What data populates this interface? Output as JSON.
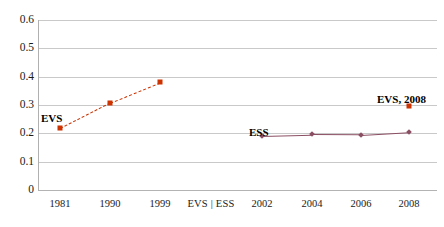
{
  "chart_data": {
    "type": "line",
    "title": "",
    "subtitle": "",
    "xlabel": "",
    "ylabel": "",
    "ylim": [
      0,
      0.6
    ],
    "grid": true,
    "legend_position": "none",
    "y_ticks": [
      "0.6",
      "0.5",
      "0.4",
      "0.3",
      "0.2",
      "0.1",
      "0"
    ],
    "y_tick_values": [
      0.6,
      0.5,
      0.4,
      0.3,
      0.2,
      0.1,
      0
    ],
    "x_tick_labels": [
      "1981",
      "1990",
      "1999",
      "EVS | ESS",
      "2002",
      "2004",
      "2006",
      "2008"
    ],
    "series": [
      {
        "name": "EVS",
        "color": "#cc3300",
        "line_style": "dashed",
        "marker": "square",
        "x": [
          "1981",
          "1990",
          "1999"
        ],
        "values": [
          0.218,
          0.308,
          0.38
        ]
      },
      {
        "name": "EVS, 2008",
        "color": "#cc3300",
        "line_style": "none",
        "marker": "square",
        "x": [
          "2008"
        ],
        "values": [
          0.295
        ]
      },
      {
        "name": "ESS",
        "color": "#8b4f63",
        "line_style": "solid",
        "marker": "diamond",
        "x": [
          "2002",
          "2004",
          "2006",
          "2008"
        ],
        "values": [
          0.192,
          0.196,
          0.195,
          0.205
        ]
      }
    ],
    "annotations": [
      {
        "text": "EVS",
        "series": "EVS"
      },
      {
        "text": "ESS",
        "series": "ESS"
      },
      {
        "text": "EVS, 2008",
        "series": "EVS, 2008"
      }
    ]
  },
  "axis": {
    "y_label_0": "0.6",
    "y_label_1": "0.5",
    "y_label_2": "0.4",
    "y_label_3": "0.3",
    "y_label_4": "0.2",
    "y_label_5": "0.1",
    "y_label_6": "0",
    "x_label_0": "1981",
    "x_label_1": "1990",
    "x_label_2": "1999",
    "x_label_3": "EVS | ESS",
    "x_label_4": "2002",
    "x_label_5": "2004",
    "x_label_6": "2006",
    "x_label_7": "2008"
  },
  "annotations": {
    "evs": "EVS",
    "ess": "ESS",
    "evs_2008": "EVS, 2008"
  },
  "colors": {
    "evs": "#cc3300",
    "ess": "#8b4f63",
    "gridline": "#c9c9c9",
    "axis": "#b0b0b0",
    "text": "#1a1a1a"
  }
}
